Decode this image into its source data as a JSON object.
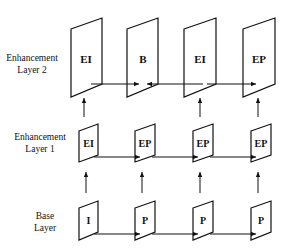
{
  "layers": [
    {
      "name": "enhancement-layer-2",
      "label_line1": "Enhancement",
      "label_line2": "Layer 2",
      "frames": [
        "EI",
        "B",
        "EI",
        "EP"
      ]
    },
    {
      "name": "enhancement-layer-1",
      "label_line1": "Enhancement",
      "label_line2": "Layer 1",
      "frames": [
        "EI",
        "EP",
        "EP",
        "EP"
      ]
    },
    {
      "name": "base-layer",
      "label_line1": "Base",
      "label_line2": "Layer",
      "frames": [
        "I",
        "P",
        "P",
        "P"
      ]
    }
  ],
  "colors": {
    "stroke": "#111111",
    "background": "#ffffff"
  }
}
